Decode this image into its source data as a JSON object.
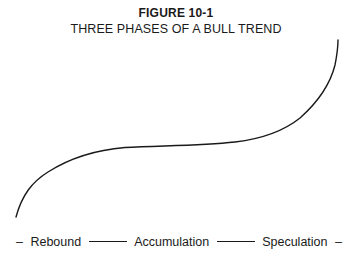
{
  "figure": {
    "label": "FIGURE 10-1",
    "title": "THREE PHASES OF A BULL TREND"
  },
  "phases": [
    {
      "label": "Rebound"
    },
    {
      "label": "Accumulation"
    },
    {
      "label": "Speculation"
    }
  ],
  "separators": {
    "lead": "–",
    "tail": "–"
  },
  "curve": {
    "description": "S-shaped rising trend: steep rebound, flattening accumulation plateau, steep speculative rise",
    "stroke_color": "#1a1a1a"
  }
}
